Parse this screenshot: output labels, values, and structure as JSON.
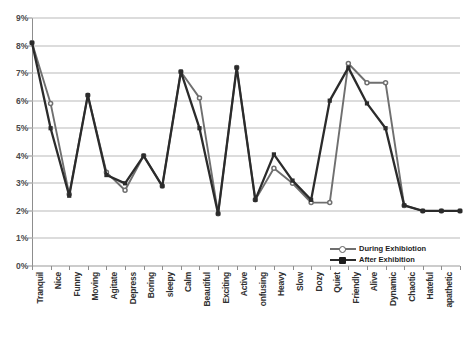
{
  "chart_data": {
    "type": "line",
    "title": "",
    "xlabel": "",
    "ylabel": "",
    "ylim": [
      0,
      9
    ],
    "ytick_values": [
      0,
      1,
      2,
      3,
      4,
      5,
      6,
      7,
      8,
      9
    ],
    "ytick_labels": [
      "0%",
      "1%",
      "2%",
      "3%",
      "4%",
      "5%",
      "6%",
      "7%",
      "8%",
      "9%"
    ],
    "grid": "horizontal",
    "legend_position": "bottom-right",
    "categories": [
      "Tranquil",
      "Nice",
      "Funny",
      "Moving",
      "Agitate",
      "Depress",
      "Boring",
      "sleepy",
      "Calm",
      "Beautiful",
      "Exciting",
      "Active",
      "onfusing",
      "Heavy",
      "Slow",
      "Dozy",
      "Quiet",
      "Friendly",
      "Alive",
      "Dynamic",
      "Chaotic",
      "Hateful",
      "apathetic",
      "Lazy"
    ],
    "series": [
      {
        "name": "During Exhibiotion",
        "color": "#6f6f6f",
        "marker": "open-circle",
        "values": [
          8.1,
          5.9,
          2.6,
          6.2,
          3.4,
          2.75,
          4.0,
          2.9,
          7.05,
          6.1,
          1.9,
          7.2,
          2.4,
          3.55,
          3.0,
          2.3,
          2.3,
          7.35,
          6.65,
          6.65,
          2.2,
          2.0,
          2.0,
          2.0
        ]
      },
      {
        "name": "After Exhibition",
        "color": "#2b2b2b",
        "marker": "filled-square",
        "values": [
          8.1,
          5.0,
          2.55,
          6.2,
          3.3,
          3.0,
          4.0,
          2.9,
          7.05,
          5.0,
          1.9,
          7.2,
          2.4,
          4.05,
          3.1,
          2.4,
          6.0,
          7.2,
          5.9,
          5.0,
          2.2,
          2.0,
          2.0,
          2.0
        ]
      }
    ]
  },
  "legend": {
    "items": [
      {
        "label": "During Exhibiotion"
      },
      {
        "label": "After Exhibition"
      }
    ]
  },
  "caption": {
    "text": ""
  }
}
